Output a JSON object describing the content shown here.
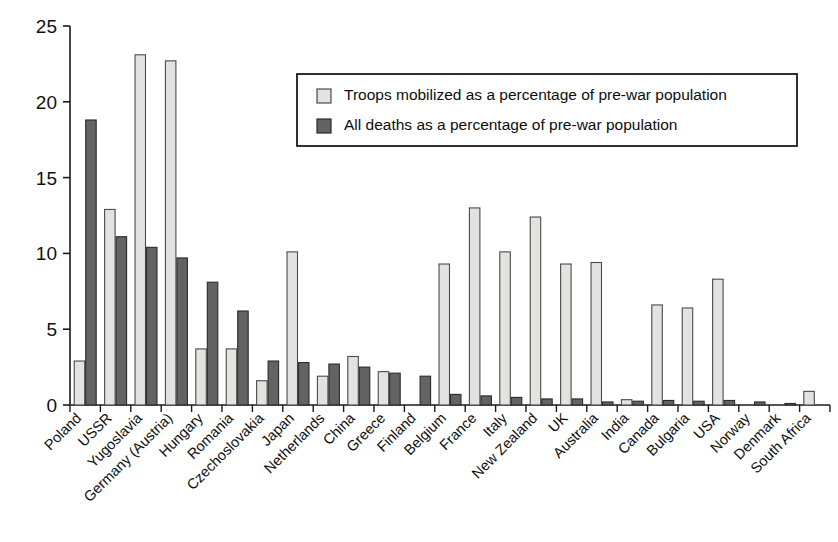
{
  "chart_data": {
    "type": "bar",
    "title": "",
    "xlabel": "",
    "ylabel": "",
    "ylim": [
      0,
      25
    ],
    "yticks": [
      0,
      5,
      10,
      15,
      20,
      25
    ],
    "grid": false,
    "legend_position": "upper-right",
    "categories": [
      "Poland",
      "USSR",
      "Yugoslavia",
      "Germany (Austria)",
      "Hungary",
      "Romania",
      "Czechoslovakia",
      "Japan",
      "Netherlands",
      "China",
      "Greece",
      "Finland",
      "Belgium",
      "France",
      "Italy",
      "New Zealand",
      "UK",
      "Australia",
      "India",
      "Canada",
      "Bulgaria",
      "USA",
      "Norway",
      "Denmark",
      "South Africa"
    ],
    "series": [
      {
        "name": "Troops mobilized as a percentage of pre-war population",
        "color": "#e2e2e0",
        "edge": "#4a4a4a",
        "values": [
          2.9,
          12.9,
          23.1,
          22.7,
          3.7,
          3.7,
          1.6,
          10.1,
          1.9,
          3.2,
          2.2,
          0.0,
          9.3,
          13.0,
          10.1,
          12.4,
          9.3,
          9.4,
          0.35,
          6.6,
          6.4,
          8.3,
          0.0,
          0.0,
          0.9
        ]
      },
      {
        "name": "All deaths as a percentage of pre-war population",
        "color": "#636363",
        "edge": "#2a2a2a",
        "values": [
          18.8,
          11.1,
          10.4,
          9.7,
          8.1,
          6.2,
          2.9,
          2.8,
          2.7,
          2.5,
          2.1,
          1.9,
          0.7,
          0.6,
          0.5,
          0.4,
          0.4,
          0.2,
          0.25,
          0.3,
          0.25,
          0.3,
          0.2,
          0.1,
          0.0
        ]
      }
    ]
  },
  "axis": {
    "y_tick_labels": [
      "0",
      "5",
      "10",
      "15",
      "20",
      "25"
    ]
  },
  "legend": {
    "items": [
      {
        "label": "Troops mobilized as a percentage of pre-war population",
        "swatch": "light-swatch-icon"
      },
      {
        "label": "All deaths as a percentage of pre-war population",
        "swatch": "dark-swatch-icon"
      }
    ]
  }
}
